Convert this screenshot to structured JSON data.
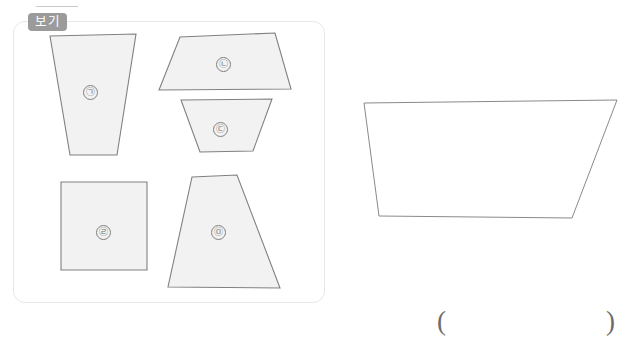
{
  "page": {
    "width": 626,
    "height": 347,
    "background": "#ffffff"
  },
  "colors": {
    "shape_fill": "#f2f2f2",
    "shape_stroke": "#808080",
    "target_fill": "#ffffff",
    "target_stroke": "#8a8a8a",
    "badge_background": "#9b9b9b",
    "badge_text": "#ffffff",
    "container_border": "#e7e7e7",
    "label_text": "#6f6f6f",
    "paren_text": "#6b6b6b",
    "rule": "#c9c9c9"
  },
  "example_panel": {
    "badge_label": "보기",
    "shapes": [
      {
        "id": "shape-a",
        "label": "㉠",
        "label_name": "circled-giyeok",
        "kind": "trapezoid",
        "points": "50,36 136,34 117,155 70,155",
        "label_x": 90,
        "label_y": 92
      },
      {
        "id": "shape-b",
        "label": "㉡",
        "label_name": "circled-nieun",
        "kind": "trapezoid",
        "points": "180,37 275,33 291,89 159,90",
        "label_x": 223,
        "label_y": 64
      },
      {
        "id": "shape-c",
        "label": "㉢",
        "label_name": "circled-digeut",
        "kind": "trapezoid",
        "points": "181,100 272,99 253,151 200,152",
        "label_x": 220,
        "label_y": 129
      },
      {
        "id": "shape-d",
        "label": "㉣",
        "label_name": "circled-rieul",
        "kind": "square",
        "points": "61,182 147,182 147,270 61,270",
        "label_x": 103,
        "label_y": 232
      },
      {
        "id": "shape-e",
        "label": "㉤",
        "label_name": "circled-mieum",
        "kind": "trapezoid",
        "points": "192,177 237,175 280,288 168,287",
        "label_x": 218,
        "label_y": 232
      }
    ]
  },
  "target_figure": {
    "name": "target-trapezoid",
    "points": "364,103 617,100 572,218 379,216"
  },
  "answer_blank": {
    "open_paren": "(",
    "close_paren": ")"
  }
}
